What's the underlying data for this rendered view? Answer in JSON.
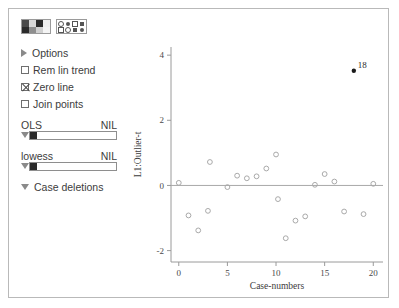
{
  "window": {
    "title": "Regression diagnostics"
  },
  "panel": {
    "icons": [
      {
        "name": "palette-icon",
        "cells": [
          "#4a4a4a",
          "#d8d8d8",
          "#2b2b2b",
          "#efefef",
          "#2b2b2b",
          "#8f8f8f",
          "#d0d0d0",
          "#f4f4f4"
        ]
      },
      {
        "name": "marker-style-icon",
        "glyphs": [
          "dot",
          "dotf",
          "sq",
          "sqf",
          "sq",
          "dot",
          "sqf",
          "dotf"
        ]
      }
    ],
    "options_label": "Options",
    "checkboxes": [
      {
        "label": "Rem lin trend",
        "checked": false
      },
      {
        "label": "Zero line",
        "checked": true
      },
      {
        "label": "Join points",
        "checked": false
      }
    ],
    "sliders": [
      {
        "label": "OLS",
        "value_label": "NIL",
        "fill_percent": 8
      },
      {
        "label": "lowess",
        "value_label": "NIL",
        "fill_percent": 8
      }
    ],
    "case_deletions_label": "Case deletions"
  },
  "chart_data": {
    "type": "scatter",
    "title": "",
    "xlabel": "Case-numbers",
    "ylabel": "L1:Outlier-t",
    "xlim": [
      -0.8,
      21.0
    ],
    "ylim": [
      -2.35,
      4.25
    ],
    "xticks": [
      0,
      5,
      10,
      15,
      20
    ],
    "yticks": [
      -2,
      0,
      2,
      4
    ],
    "grid": false,
    "zero_line": true,
    "zero_line_value": 0,
    "legend": "none",
    "series": [
      {
        "name": "cases",
        "marker": "open-circle",
        "points": [
          {
            "x": 0.0,
            "y": 0.08
          },
          {
            "x": 1.0,
            "y": -0.92
          },
          {
            "x": 2.0,
            "y": -1.38
          },
          {
            "x": 3.0,
            "y": -0.78
          },
          {
            "x": 3.2,
            "y": 0.72
          },
          {
            "x": 5.0,
            "y": -0.05
          },
          {
            "x": 6.0,
            "y": 0.3
          },
          {
            "x": 7.0,
            "y": 0.22
          },
          {
            "x": 8.0,
            "y": 0.28
          },
          {
            "x": 9.0,
            "y": 0.52
          },
          {
            "x": 10.0,
            "y": 0.95
          },
          {
            "x": 10.2,
            "y": -0.42
          },
          {
            "x": 11.0,
            "y": -1.62
          },
          {
            "x": 12.0,
            "y": -1.08
          },
          {
            "x": 13.0,
            "y": -0.95
          },
          {
            "x": 14.0,
            "y": 0.02
          },
          {
            "x": 15.0,
            "y": 0.35
          },
          {
            "x": 16.0,
            "y": 0.12
          },
          {
            "x": 17.0,
            "y": -0.8
          },
          {
            "x": 19.0,
            "y": -0.88
          },
          {
            "x": 20.0,
            "y": 0.05
          }
        ]
      },
      {
        "name": "flagged",
        "marker": "filled-circle",
        "points": [
          {
            "x": 18.0,
            "y": 3.52,
            "label": "18"
          }
        ]
      }
    ]
  }
}
